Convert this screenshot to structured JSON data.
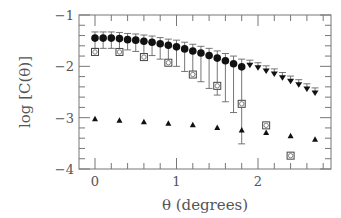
{
  "chart_data": {
    "type": "scatter",
    "title": "",
    "xlabel": "θ (degrees)",
    "ylabel": "log [C(θ)]",
    "xlim": [
      -0.2,
      2.9
    ],
    "ylim": [
      -4,
      -1
    ],
    "xticks": [
      0,
      1,
      2
    ],
    "yticks": [
      -1,
      -2,
      -3,
      -4
    ],
    "grid": false,
    "legend": null,
    "series": [
      {
        "name": "filled circles (with error bars)",
        "marker": "filled-circle",
        "x": [
          0.0,
          0.1,
          0.2,
          0.3,
          0.4,
          0.5,
          0.6,
          0.7,
          0.8,
          0.9,
          1.0,
          1.1,
          1.2,
          1.3,
          1.4,
          1.5,
          1.6,
          1.7,
          1.8
        ],
        "y": [
          -1.45,
          -1.45,
          -1.45,
          -1.46,
          -1.48,
          -1.49,
          -1.51,
          -1.53,
          -1.56,
          -1.59,
          -1.62,
          -1.66,
          -1.7,
          -1.74,
          -1.79,
          -1.84,
          -1.89,
          -1.95,
          -2.01
        ],
        "err_low": [
          0.2,
          0.2,
          0.2,
          0.2,
          0.2,
          0.22,
          0.24,
          0.26,
          0.3,
          0.34,
          0.38,
          0.44,
          0.5,
          0.56,
          0.64,
          0.72,
          0.8,
          0.95,
          1.5
        ],
        "err_high": [
          0.12,
          0.12,
          0.12,
          0.12,
          0.12,
          0.12,
          0.12,
          0.12,
          0.12,
          0.12,
          0.13,
          0.13,
          0.13,
          0.13,
          0.14,
          0.14,
          0.14,
          0.15,
          0.15
        ]
      },
      {
        "name": "upper limits",
        "marker": "down-triangle",
        "x": [
          1.9,
          2.0,
          2.1,
          2.2,
          2.3,
          2.4,
          2.5,
          2.6,
          2.7
        ],
        "y": [
          -1.98,
          -2.03,
          -2.09,
          -2.15,
          -2.22,
          -2.29,
          -2.36,
          -2.44,
          -2.52
        ],
        "err_high": [
          0.1,
          0.1,
          0.1,
          0.1,
          0.1,
          0.1,
          0.1,
          0.1,
          0.1
        ]
      },
      {
        "name": "open squares",
        "marker": "open-square",
        "x": [
          0.0,
          0.3,
          0.6,
          0.9,
          1.2,
          1.5,
          1.8,
          2.1,
          2.4
        ],
        "y": [
          -1.72,
          -1.72,
          -1.82,
          -1.93,
          -2.16,
          -2.38,
          -2.73,
          -3.15,
          -3.74
        ]
      },
      {
        "name": "filled triangles",
        "marker": "filled-triangle",
        "x": [
          0.0,
          0.3,
          0.6,
          0.9,
          1.2,
          1.5,
          1.8,
          2.1,
          2.4,
          2.7
        ],
        "y": [
          -3.02,
          -3.05,
          -3.08,
          -3.11,
          -3.14,
          -3.19,
          -3.24,
          -3.29,
          -3.35,
          -3.42
        ]
      }
    ]
  }
}
